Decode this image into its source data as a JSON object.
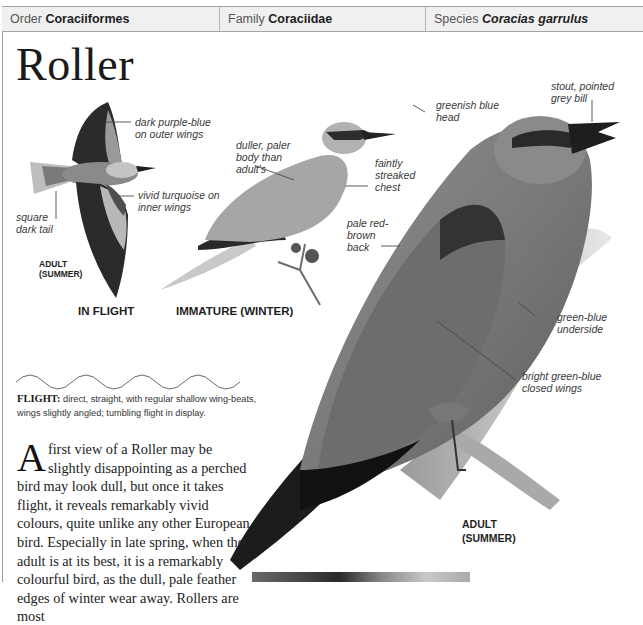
{
  "header": {
    "order_label": "Order",
    "order_value": "Coraciiformes",
    "family_label": "Family",
    "family_value": "Coraciidae",
    "species_label": "Species",
    "species_value": "Coracias garrulus"
  },
  "title": "Roller",
  "illustrations": {
    "in_flight": {
      "caption": "IN FLIGHT",
      "sub_caption_1": "ADULT",
      "sub_caption_2": "(SUMMER)",
      "labels": [
        {
          "line1": "dark purple-blue",
          "line2": "on outer wings"
        },
        {
          "line1": "vivid turquoise on",
          "line2": "inner wings"
        },
        {
          "line1": "square",
          "line2": "dark tail"
        }
      ]
    },
    "immature": {
      "caption": "IMMATURE (WINTER)",
      "labels": [
        {
          "line1": "duller, paler",
          "line2": "body than",
          "line3": "adult's"
        },
        {
          "line1": "faintly",
          "line2": "streaked",
          "line3": "chest"
        }
      ]
    },
    "adult": {
      "caption_1": "ADULT",
      "caption_2": "(SUMMER)",
      "labels": [
        {
          "line1": "stout, pointed",
          "line2": "grey bill"
        },
        {
          "line1": "greenish blue",
          "line2": "head"
        },
        {
          "line1": "pale red-",
          "line2": "brown",
          "line3": "back"
        },
        {
          "line1": "green-blue",
          "line2": "underside"
        },
        {
          "line1": "bright green-blue",
          "line2": "closed wings"
        }
      ]
    }
  },
  "flight": {
    "label": "FLIGHT:",
    "text": " direct, straight, with regular shallow wing-beats, wings slightly angled; tumbling flight in display."
  },
  "body": {
    "dropcap": "A",
    "text": "first view of a Roller may be slightly disappointing as a perched bird may look dull, but once it takes flight, it reveals remarkably vivid colours, quite unlike any other European bird. Especially in late spring, when the adult is at its best, it is a remarkably colourful bird, as the dull, pale feather edges of winter wear away. Rollers are most"
  },
  "colors": {
    "header_bg": "#f0f0f0",
    "border": "#a5a5a5",
    "text": "#222222"
  }
}
